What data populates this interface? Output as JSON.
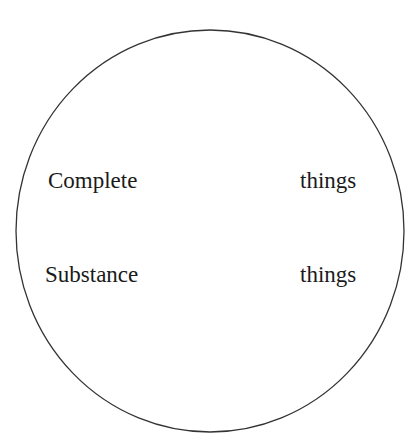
{
  "diagram": {
    "shape": "ellipse",
    "stroke_color": "#333333",
    "labels": [
      {
        "id": "complete",
        "text": "Complete"
      },
      {
        "id": "things-1",
        "text": "things"
      },
      {
        "id": "substance",
        "text": "Substance"
      },
      {
        "id": "things-2",
        "text": "things"
      }
    ]
  }
}
